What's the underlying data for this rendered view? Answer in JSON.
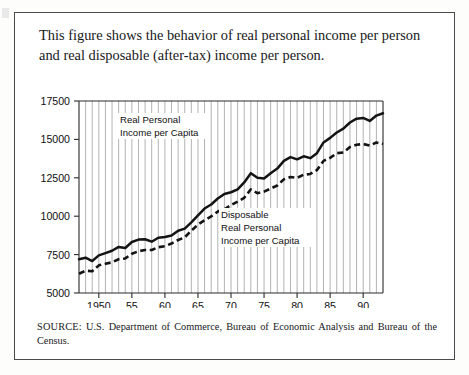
{
  "figure": {
    "caption": "This figure shows the behavior of real personal income per person and real disposable (after-tax) income per person.",
    "source_label": "SOURCE:",
    "source_text": "U.S. Department of Commerce, Bureau of Economic Analysis and Bureau of the Census."
  },
  "annotations": {
    "personal": {
      "line1": "Real Personal",
      "line2": "Income per Capita"
    },
    "disposable": {
      "line1": "Disposable",
      "line2": "Real Personal",
      "line3": "Income per Capita"
    }
  },
  "chart_data": {
    "type": "line",
    "title": "",
    "subtitle": "",
    "xlabel": "",
    "ylabel": "",
    "xlim": [
      1947,
      1993
    ],
    "ylim": [
      5000,
      17500
    ],
    "yticks": [
      5000,
      7500,
      10000,
      12500,
      15000,
      17500
    ],
    "ytick_labels": [
      "5000",
      "7500",
      "10000",
      "12500",
      "15000",
      "17500"
    ],
    "xticks": [
      1950,
      1955,
      1960,
      1965,
      1970,
      1975,
      1980,
      1985,
      1990
    ],
    "xtick_labels": [
      "1950",
      "55",
      "60",
      "65",
      "70",
      "75",
      "80",
      "85",
      "90"
    ],
    "grid": "vertical-yearly",
    "legend": "inline-annotations",
    "x": [
      1947,
      1948,
      1949,
      1950,
      1951,
      1952,
      1953,
      1954,
      1955,
      1956,
      1957,
      1958,
      1959,
      1960,
      1961,
      1962,
      1963,
      1964,
      1965,
      1966,
      1967,
      1968,
      1969,
      1970,
      1971,
      1972,
      1973,
      1974,
      1975,
      1976,
      1977,
      1978,
      1979,
      1980,
      1981,
      1982,
      1983,
      1984,
      1985,
      1986,
      1987,
      1988,
      1989,
      1990,
      1991,
      1992,
      1993
    ],
    "series": [
      {
        "name": "Real Personal Income per Capita",
        "style": "solid",
        "values": [
          7200,
          7300,
          7080,
          7450,
          7600,
          7750,
          8000,
          7930,
          8320,
          8480,
          8500,
          8340,
          8600,
          8650,
          8740,
          9050,
          9190,
          9600,
          10050,
          10500,
          10760,
          11150,
          11450,
          11560,
          11750,
          12200,
          12800,
          12500,
          12450,
          12800,
          13100,
          13600,
          13850,
          13700,
          13900,
          13780,
          14100,
          14800,
          15100,
          15450,
          15700,
          16100,
          16350,
          16400,
          16200,
          16550,
          16700
        ]
      },
      {
        "name": "Disposable Real Personal Income per Capita",
        "style": "dashed",
        "values": [
          6250,
          6450,
          6420,
          6800,
          6900,
          7000,
          7200,
          7250,
          7550,
          7720,
          7800,
          7800,
          7980,
          8050,
          8220,
          8450,
          8620,
          9060,
          9450,
          9740,
          9990,
          10300,
          10450,
          10720,
          10950,
          11200,
          11750,
          11500,
          11600,
          11800,
          12000,
          12400,
          12550,
          12500,
          12700,
          12750,
          13000,
          13600,
          13800,
          14100,
          14150,
          14500,
          14650,
          14700,
          14600,
          14800,
          14700
        ]
      }
    ]
  }
}
